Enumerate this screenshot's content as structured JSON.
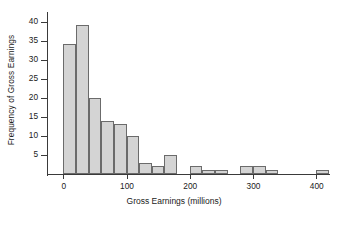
{
  "chart_data": {
    "type": "bar",
    "title": "",
    "xlabel": "Gross Earnings (millions)",
    "ylabel": "Frequency of Gross Earnings",
    "xlim": [
      -10,
      425
    ],
    "ylim": [
      0,
      42
    ],
    "xticks": [
      0,
      100,
      200,
      300,
      400
    ],
    "xtick_labels": [
      "0",
      "100",
      "200",
      "300",
      "400"
    ],
    "yticks": [
      5,
      10,
      15,
      20,
      25,
      30,
      35,
      40
    ],
    "ytick_labels": [
      "5",
      "10",
      "15",
      "20",
      "25",
      "30",
      "35",
      "40"
    ],
    "grid": false,
    "legend": null,
    "bin_width": 20,
    "bin_edges": [
      0,
      20,
      40,
      60,
      80,
      100,
      120,
      140,
      160,
      180,
      200,
      220,
      240,
      260,
      280,
      300,
      320,
      340,
      400,
      420
    ],
    "bars": [
      {
        "x0": 0,
        "x1": 20,
        "value": 34
      },
      {
        "x0": 20,
        "x1": 40,
        "value": 39
      },
      {
        "x0": 40,
        "x1": 60,
        "value": 20
      },
      {
        "x0": 60,
        "x1": 80,
        "value": 14
      },
      {
        "x0": 80,
        "x1": 100,
        "value": 13
      },
      {
        "x0": 100,
        "x1": 120,
        "value": 10
      },
      {
        "x0": 120,
        "x1": 140,
        "value": 3
      },
      {
        "x0": 140,
        "x1": 160,
        "value": 2
      },
      {
        "x0": 160,
        "x1": 180,
        "value": 5
      },
      {
        "x0": 200,
        "x1": 220,
        "value": 2
      },
      {
        "x0": 220,
        "x1": 240,
        "value": 1
      },
      {
        "x0": 240,
        "x1": 260,
        "value": 1
      },
      {
        "x0": 280,
        "x1": 300,
        "value": 2
      },
      {
        "x0": 300,
        "x1": 320,
        "value": 2
      },
      {
        "x0": 320,
        "x1": 340,
        "value": 1
      },
      {
        "x0": 400,
        "x1": 420,
        "value": 1
      }
    ],
    "categories": [
      "0-20",
      "20-40",
      "40-60",
      "60-80",
      "80-100",
      "100-120",
      "120-140",
      "140-160",
      "160-180",
      "200-220",
      "220-240",
      "240-260",
      "280-300",
      "300-320",
      "320-340",
      "400-420"
    ],
    "values": [
      34,
      39,
      20,
      14,
      13,
      10,
      3,
      2,
      5,
      2,
      1,
      1,
      2,
      2,
      1,
      1
    ],
    "colors": {
      "bar_fill": "#d4d4d4",
      "bar_border": "#6b6b6b",
      "axis": "#3a3a3a",
      "text": "#1a1a1a",
      "background": "#ffffff"
    }
  }
}
